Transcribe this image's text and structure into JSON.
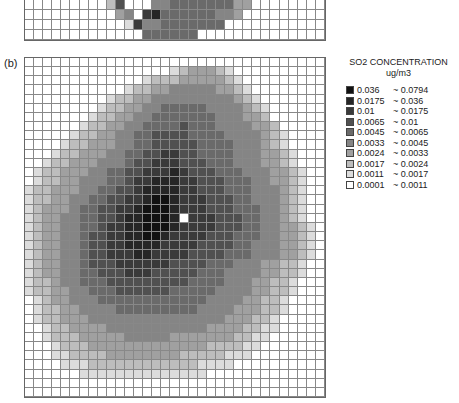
{
  "panel_b_label": "(b)",
  "legend": {
    "title": "SO2 CONCENTRATION",
    "unit": "ug/m3",
    "items": [
      {
        "low": "0.036",
        "high": "~ 0.0794",
        "color": "#111111"
      },
      {
        "low": "0.0175",
        "high": "~ 0.036",
        "color": "#262626"
      },
      {
        "low": "0.01",
        "high": "~ 0.0175",
        "color": "#3a3a3a"
      },
      {
        "low": "0.0065",
        "high": "~ 0.01",
        "color": "#505050"
      },
      {
        "low": "0.0045",
        "high": "~ 0.0065",
        "color": "#6a6a6a"
      },
      {
        "low": "0.0033",
        "high": "~ 0.0045",
        "color": "#858585"
      },
      {
        "low": "0.0024",
        "high": "~ 0.0033",
        "color": "#a0a0a0"
      },
      {
        "low": "0.0017",
        "high": "~ 0.0024",
        "color": "#bdbdbd"
      },
      {
        "low": "0.0011",
        "high": "~ 0.0017",
        "color": "#dcdcdc"
      },
      {
        "low": "0.0001",
        "high": "~ 0.0011",
        "color": "#ffffff"
      }
    ]
  },
  "panel_a_strip": {
    "cols": 33,
    "rows": 4,
    "data": [
      "000000000260004455555553300000000",
      "000000000034078555555443000000000",
      "000000000001744555555500000000000",
      "000000000000055555500000000000000"
    ]
  },
  "panel_b": {
    "cols": 33,
    "rows": 37,
    "source_marker": {
      "col": 17,
      "row": 17
    },
    "data": [
      "000000000000000000000000000000000",
      "000000000000000012333210000000000",
      "000000000000012223333321000000000",
      "000000000001223344444332100000000",
      "000000000122334444444443210000000",
      "000000001223344555554444321000000",
      "000000012233445555555444332000000",
      "000000122334455556555444433200000",
      "000001223344556666555544443210000",
      "000012233344556666655554443210000",
      "000122333445566776655554443321000",
      "001223334445667776665554443321000",
      "012233344556677787666555444332100",
      "012233444556778887766655544332100",
      "122333445566788887766655544432100",
      "122334455667789987776665544432100",
      "123334556677899987776665554432100",
      "123344556678899987777666554432100",
      "123344556778899987777666554433210",
      "123344566778899877776665554433210",
      "123344566778888777766665544433210",
      "123344566777887777666655544433210",
      "123344566677777766665554443322100",
      "123344556667776666655544443322100",
      "122344555666666666555544433221000",
      "122334455566666655555444433221000",
      "012334445555555555554444332210000",
      "012233444455555555544443332210000",
      "012233344444444444444433322100000",
      "001223333444444444443333221100000",
      "001222333334444433333332211000000",
      "000122233333333333332222110000000",
      "000112222333333332222211100000000",
      "000011122222222222211110000000000",
      "000000111111111111110000000000000",
      "000000000000000000000000000000000",
      "000000000000000000000000000000000"
    ]
  }
}
